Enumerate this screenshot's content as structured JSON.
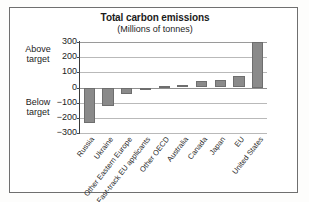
{
  "chart_data": {
    "type": "bar",
    "title": "Total carbon emissions",
    "subtitle": "(Millions of tonnes)",
    "xlabel": "",
    "ylabel": "",
    "ylim": [
      -300,
      300
    ],
    "yticks": [
      "300",
      "200",
      "100",
      "0",
      "−100",
      "−200",
      "−300"
    ],
    "ytick_values": [
      300,
      200,
      100,
      0,
      -100,
      -200,
      -300
    ],
    "grid": true,
    "legend": "none",
    "bar_color": "#8a8a8a",
    "categories": [
      "Russia",
      "Ukraine",
      "Other Eastern Europe",
      "Fast-track EU applicants",
      "Other OECD",
      "Australia",
      "Canada",
      "Japan",
      "EU",
      "United States"
    ],
    "values": [
      -235,
      -125,
      -45,
      -8,
      12,
      18,
      40,
      50,
      78,
      300
    ],
    "annotations": [
      {
        "text": "Above target",
        "position": "left-upper"
      },
      {
        "text": "Below target",
        "position": "left-lower"
      }
    ]
  },
  "annotations": {
    "above_target_line1": "Above",
    "above_target_line2": "target",
    "below_target_line1": "Below",
    "below_target_line2": "target"
  }
}
